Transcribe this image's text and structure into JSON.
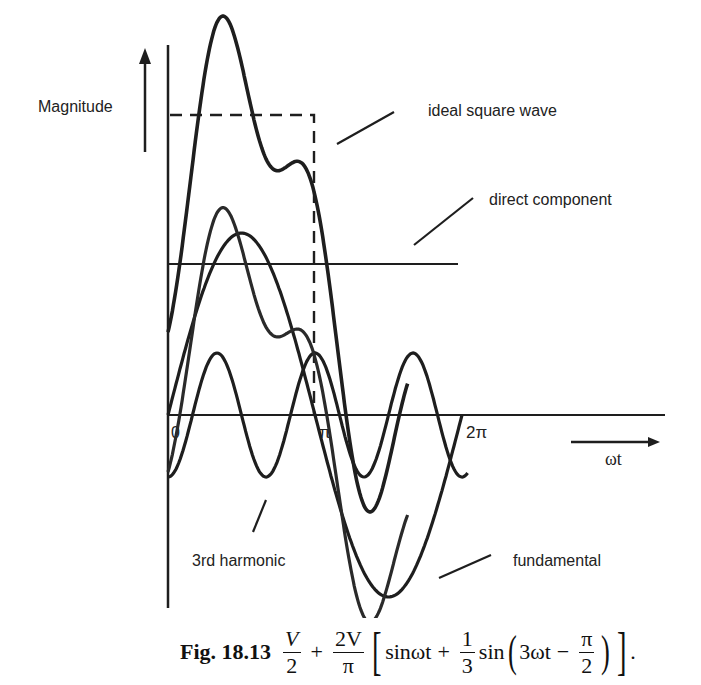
{
  "figure": {
    "y_axis_label": "Magnitude",
    "x_axis_label": "ωt",
    "tick_labels": {
      "zero": "0",
      "pi": "π",
      "two_pi": "2π"
    },
    "annotations": {
      "ideal_square_wave": "ideal square wave",
      "direct_component": "direct component",
      "third_harmonic": "3rd harmonic",
      "fundamental": "fundamental"
    },
    "colors": {
      "ink": "#1e1e1e",
      "background": "#ffffff"
    }
  },
  "caption": {
    "prefix": "Fig. 18.13",
    "t1_num": "V",
    "t1_den": "2",
    "plus1": "+",
    "t2_num": "2V",
    "t2_den": "π",
    "open_bracket": "[",
    "sin1": "sinωt",
    "plus2": "+",
    "t3_num": "1",
    "t3_den": "3",
    "sin2": "sin",
    "open_paren": "(",
    "arg": "3ωt",
    "minus": "−",
    "t4_num": "π",
    "t4_den": "2",
    "close_paren": ")",
    "close_bracket": "]",
    "period": "."
  },
  "chart_data": {
    "type": "line",
    "xlabel": "ωt",
    "ylabel": "Magnitude",
    "x_ticks": [
      {
        "value": 0,
        "label": "0"
      },
      {
        "value": 3.1416,
        "label": "π"
      },
      {
        "value": 6.2832,
        "label": "2π"
      }
    ],
    "x_range": [
      0,
      6.2832
    ],
    "y_range_normalized": [
      -1.0,
      2.15
    ],
    "grid": false,
    "legend": "inline annotations with leader lines",
    "series": [
      {
        "name": "ideal square wave",
        "style": "dashed",
        "definition": "V for 0 < ωt < π, 0 afterwards",
        "level": 1.65
      },
      {
        "name": "direct component",
        "style": "solid-thin",
        "definition": "V/2",
        "level": 0.83
      },
      {
        "name": "fundamental",
        "style": "solid-thick",
        "definition": "(2V/π) sin ωt",
        "amplitude": 1.0
      },
      {
        "name": "3rd harmonic",
        "style": "solid-thick",
        "definition": "(2V/3π) sin(3ωt − π/2)",
        "amplitude": 0.34
      },
      {
        "name": "fundamental + 3rd harmonic",
        "style": "solid-thick",
        "definition": "sinωt + (1/3)sin(3ωt − π/2)"
      },
      {
        "name": "resultant",
        "style": "solid-thick",
        "definition": "V/2 + (2V/π)[sinωt + (1/3)sin(3ωt − π/2)]"
      }
    ],
    "sample_points": {
      "x": [
        0,
        0.785,
        1.571,
        2.356,
        3.142,
        3.927,
        4.712,
        5.498,
        6.283
      ],
      "fundamental": [
        0,
        0.71,
        1.0,
        0.71,
        0,
        -0.71,
        -1.0,
        -0.71,
        0
      ],
      "third_harmonic": [
        -0.34,
        0.24,
        0,
        -0.24,
        0.34,
        -0.24,
        0,
        0.24,
        -0.34
      ],
      "resultant": [
        0.49,
        1.78,
        1.83,
        1.3,
        1.17,
        -0.12,
        -0.17,
        0.36,
        0.49
      ]
    },
    "pixel_mapping": {
      "origin_x": 168,
      "origin_y": 415,
      "px_per_pi": 147,
      "dc_px": 151,
      "fund_amp_px": 182,
      "third_amp_px": 62,
      "resultant_gain": 1.1
    }
  }
}
